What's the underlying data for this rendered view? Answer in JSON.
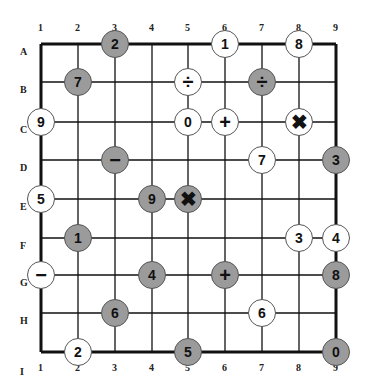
{
  "puzzle": {
    "columns": [
      "1",
      "2",
      "3",
      "4",
      "5",
      "6",
      "7",
      "8",
      "9"
    ],
    "rows": [
      "A",
      "B",
      "C",
      "D",
      "E",
      "F",
      "G",
      "H",
      "I"
    ],
    "bottom_columns": [
      "1",
      "2",
      "3",
      "4",
      "5",
      "6",
      "7",
      "8",
      "9"
    ],
    "bottom_row_label": "I",
    "colors": {
      "gray_node": "#9b9b9b",
      "white_node": "#ffffff",
      "line": "#111111"
    },
    "nodes": [
      {
        "row": "A",
        "col": 3,
        "value": "2",
        "fill": "gray"
      },
      {
        "row": "A",
        "col": 6,
        "value": "1",
        "fill": "white"
      },
      {
        "row": "A",
        "col": 8,
        "value": "8",
        "fill": "white"
      },
      {
        "row": "B",
        "col": 2,
        "value": "7",
        "fill": "gray"
      },
      {
        "row": "B",
        "col": 5,
        "value": "÷",
        "fill": "white",
        "symbol": "divide-icon"
      },
      {
        "row": "B",
        "col": 7,
        "value": "÷",
        "fill": "gray",
        "symbol": "divide-icon"
      },
      {
        "row": "C",
        "col": 1,
        "value": "9",
        "fill": "white"
      },
      {
        "row": "C",
        "col": 5,
        "value": "0",
        "fill": "white"
      },
      {
        "row": "C",
        "col": 6,
        "value": "+",
        "fill": "white",
        "symbol": "plus-icon"
      },
      {
        "row": "C",
        "col": 8,
        "value": "✖",
        "fill": "white",
        "symbol": "multiply-icon"
      },
      {
        "row": "D",
        "col": 3,
        "value": "−",
        "fill": "gray",
        "symbol": "minus-icon"
      },
      {
        "row": "D",
        "col": 7,
        "value": "7",
        "fill": "white"
      },
      {
        "row": "D",
        "col": 9,
        "value": "3",
        "fill": "gray"
      },
      {
        "row": "E",
        "col": 1,
        "value": "5",
        "fill": "white"
      },
      {
        "row": "E",
        "col": 4,
        "value": "9",
        "fill": "gray"
      },
      {
        "row": "E",
        "col": 5,
        "value": "✖",
        "fill": "gray",
        "symbol": "multiply-icon"
      },
      {
        "row": "F",
        "col": 2,
        "value": "1",
        "fill": "gray"
      },
      {
        "row": "F",
        "col": 8,
        "value": "3",
        "fill": "white"
      },
      {
        "row": "F",
        "col": 9,
        "value": "4",
        "fill": "white"
      },
      {
        "row": "G",
        "col": 1,
        "value": "−",
        "fill": "white",
        "symbol": "minus-icon"
      },
      {
        "row": "G",
        "col": 4,
        "value": "4",
        "fill": "gray"
      },
      {
        "row": "G",
        "col": 6,
        "value": "+",
        "fill": "gray",
        "symbol": "plus-icon"
      },
      {
        "row": "G",
        "col": 9,
        "value": "8",
        "fill": "gray"
      },
      {
        "row": "H",
        "col": 3,
        "value": "6",
        "fill": "gray"
      },
      {
        "row": "H",
        "col": 7,
        "value": "6",
        "fill": "white"
      },
      {
        "row": "I",
        "col": 2,
        "value": "2",
        "fill": "white"
      },
      {
        "row": "I",
        "col": 5,
        "value": "5",
        "fill": "gray"
      },
      {
        "row": "I",
        "col": 9,
        "value": "0",
        "fill": "gray"
      }
    ]
  }
}
